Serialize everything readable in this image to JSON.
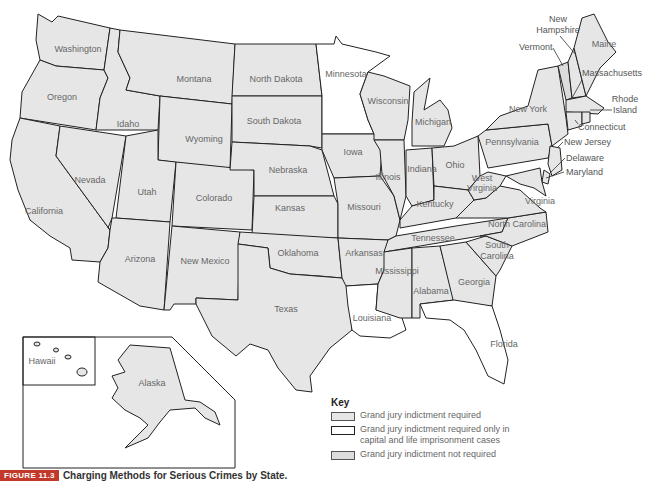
{
  "figure": {
    "badge": "FIGURE 11.3",
    "title": "Charging Methods for Serious Crimes by State."
  },
  "key": {
    "title": "Key",
    "items": [
      {
        "id": "req",
        "label": "Grand jury indictment required",
        "fill": "#e6e6e6"
      },
      {
        "id": "cap",
        "label": "Grand jury indictment required only in capital and life imprisonment cases",
        "fill": "#ffffff"
      },
      {
        "id": "noreq",
        "label": "Grand jury indictment not required",
        "fill": "#dcdcdc"
      }
    ]
  },
  "states": {
    "washington": "Washington",
    "oregon": "Oregon",
    "california": "California",
    "idaho": "Idaho",
    "nevada": "Nevada",
    "montana": "Montana",
    "wyoming": "Wyoming",
    "utah": "Utah",
    "arizona": "Arizona",
    "colorado": "Colorado",
    "new_mexico": "New Mexico",
    "north_dakota": "North Dakota",
    "south_dakota": "South Dakota",
    "nebraska": "Nebraska",
    "kansas": "Kansas",
    "oklahoma": "Oklahoma",
    "texas": "Texas",
    "minnesota": "Minnesota",
    "iowa": "Iowa",
    "missouri": "Missouri",
    "arkansas": "Arkansas",
    "louisiana": "Louisiana",
    "wisconsin": "Wisconsin",
    "illinois": "Illinois",
    "michigan": "Michigan",
    "indiana": "Indiana",
    "ohio": "Ohio",
    "kentucky": "Kentucky",
    "tennessee": "Tennessee",
    "mississippi": "Mississippi",
    "alabama": "Alabama",
    "georgia": "Georgia",
    "florida": "Florida",
    "south_carolina_1": "South",
    "south_carolina_2": "Carolina",
    "north_carolina": "North Carolina",
    "virginia": "Virginia",
    "west_virginia_1": "West",
    "west_virginia_2": "Virginia",
    "pennsylvania": "Pennsylvania",
    "new_york": "New York",
    "maine": "Maine",
    "vermont": "Vermont",
    "new_hampshire_1": "New",
    "new_hampshire_2": "Hampshire",
    "massachusetts": "Massachusetts",
    "rhode_island_1": "Rhode",
    "rhode_island_2": "Island",
    "connecticut": "Connecticut",
    "new_jersey": "New Jersey",
    "delaware": "Delaware",
    "maryland": "Maryland",
    "alaska": "Alaska",
    "hawaii": "Hawaii"
  }
}
